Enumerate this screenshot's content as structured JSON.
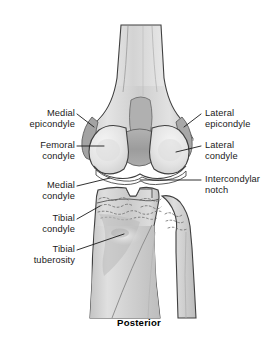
{
  "figure": {
    "caption": "Posterior",
    "view": "posterior-knee-joint",
    "colors": {
      "background": "#ffffff",
      "outline": "#3a3a3a",
      "bone_light": "#e9e9e9",
      "bone_mid": "#cccccc",
      "bone_dark": "#9e9e9e",
      "cartilage": "#f2f2f2",
      "text": "#1a1a1a"
    }
  },
  "labels": {
    "left": [
      {
        "id": "medial-epicondyle",
        "line1": "Medial",
        "line2": "epicondyle"
      },
      {
        "id": "femoral-condyle",
        "line1": "Femoral",
        "line2": "condyle"
      },
      {
        "id": "medial-condyle",
        "line1": "Medial",
        "line2": "condyle"
      },
      {
        "id": "tibial-condyle",
        "line1": "Tibial",
        "line2": "condyle"
      },
      {
        "id": "tibial-tuberosity",
        "line1": "Tibial",
        "line2": "tuberosity"
      }
    ],
    "right": [
      {
        "id": "lateral-epicondyle",
        "line1": "Lateral",
        "line2": "epicondyle"
      },
      {
        "id": "lateral-condyle",
        "line1": "Lateral",
        "line2": "condyle"
      },
      {
        "id": "intercondylar-notch",
        "line1": "Intercondylar",
        "line2": "notch"
      }
    ]
  }
}
